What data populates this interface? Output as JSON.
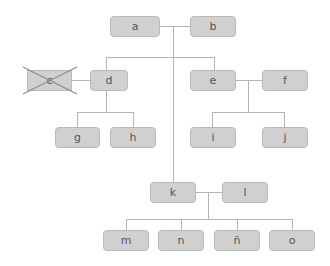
{
  "diagram": {
    "type": "family-tree",
    "nodes": {
      "a": {
        "label": "a"
      },
      "b": {
        "label": "b"
      },
      "c": {
        "label": "c",
        "crossed_out": true
      },
      "d": {
        "label": "d"
      },
      "e": {
        "label": "e"
      },
      "f": {
        "label": "f"
      },
      "g": {
        "label": "g"
      },
      "h": {
        "label": "h"
      },
      "i": {
        "label": "i"
      },
      "j": {
        "label": "j"
      },
      "k": {
        "label": "k"
      },
      "l": {
        "label": "l"
      },
      "m": {
        "label": "m"
      },
      "n": {
        "label": "n"
      },
      "n_tilde": {
        "label": "ñ"
      },
      "o": {
        "label": "o"
      }
    },
    "edges": [
      {
        "type": "couple",
        "from": "a",
        "to": "b"
      },
      {
        "type": "children",
        "parents": [
          "a",
          "b"
        ],
        "children": [
          "d",
          "e",
          "k"
        ]
      },
      {
        "type": "couple",
        "from": "c",
        "to": "d"
      },
      {
        "type": "children",
        "parents": [
          "c",
          "d"
        ],
        "children": [
          "g",
          "h"
        ]
      },
      {
        "type": "couple",
        "from": "e",
        "to": "f"
      },
      {
        "type": "children",
        "parents": [
          "e",
          "f"
        ],
        "children": [
          "i",
          "j"
        ]
      },
      {
        "type": "couple",
        "from": "k",
        "to": "l"
      },
      {
        "type": "children",
        "parents": [
          "k",
          "l"
        ],
        "children": [
          "m",
          "n",
          "ñ",
          "o"
        ]
      }
    ],
    "colors": {
      "node_fill": "#d0d0d0",
      "node_border": "#b9b9b9",
      "line": "#b4b4b4",
      "cross": "#888888",
      "text": "#555555"
    }
  }
}
